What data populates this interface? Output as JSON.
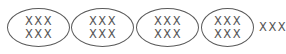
{
  "nodes": [
    {
      "line1": "XXX",
      "line2": "XXX"
    },
    {
      "line1": "XXX",
      "line2": "XXX"
    },
    {
      "line1": "XXX",
      "line2": "XXX"
    },
    {
      "line1": "XXX",
      "line2": "XXX"
    }
  ],
  "trailing_text": "XXX"
}
